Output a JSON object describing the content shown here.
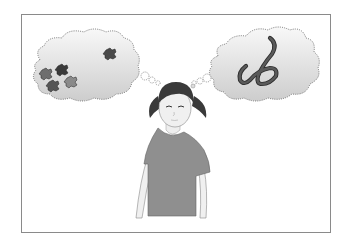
{
  "illustration": {
    "subject": "girl thinking",
    "left_thought": "puzzle pieces",
    "right_thought": "worm",
    "colors": {
      "frame": "#8a8a8a",
      "cloud_fill_top": "#f6f6f6",
      "cloud_fill_bottom": "#cfcfcf",
      "cloud_border": "#555555",
      "shirt": "#8f8f8f",
      "skin": "#efefef",
      "hair": "#3a3a3a",
      "puzzle_dark": "#3b3b3b",
      "puzzle_mid": "#6a6a6a",
      "puzzle_light": "#8a8a8a",
      "worm": "#4a4a4a"
    }
  }
}
